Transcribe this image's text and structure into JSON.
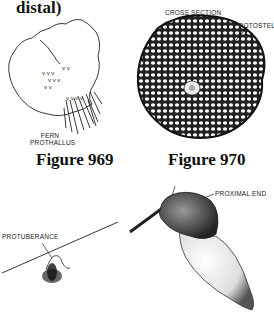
{
  "page": {
    "heading_fragment": "distal)"
  },
  "figures": [
    {
      "caption": "Figure 969",
      "labels": [
        "FERN",
        "PROTHALLUS"
      ]
    },
    {
      "caption": "Figure 970",
      "labels": [
        "CROSS SECTION",
        "PROTOSTELE"
      ]
    },
    {
      "caption": "",
      "labels": [
        "PROTUBERANCE"
      ]
    },
    {
      "caption": "",
      "labels": [
        "PROXIMAL END"
      ]
    }
  ]
}
